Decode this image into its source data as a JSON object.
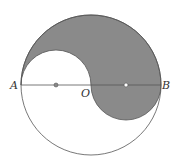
{
  "diagram": {
    "labels": {
      "A": "A",
      "O": "O",
      "B": "B"
    },
    "colors": {
      "shade": "#8a8a8a",
      "stroke": "#555555",
      "background": "#ffffff"
    }
  }
}
